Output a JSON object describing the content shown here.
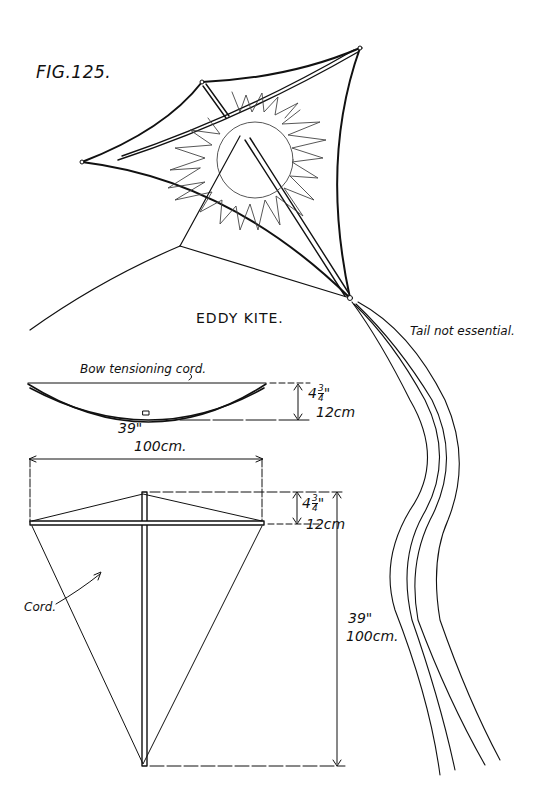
{
  "figure": {
    "number": "FIG.125.",
    "title": "EDDY KITE."
  },
  "labels": {
    "tail_note": "Tail not essential.",
    "bow_cord": "Bow tensioning cord.",
    "cord": "Cord."
  },
  "dimensions": {
    "bow_depth": {
      "whole": "4",
      "num": "3",
      "den": "4",
      "unit": "\"",
      "metric": "12cm"
    },
    "bow_width": {
      "imperial": "39\"",
      "metric": "100cm."
    },
    "frame_top": {
      "whole": "4",
      "num": "3",
      "den": "4",
      "unit": "\"",
      "metric": "12cm"
    },
    "frame_height": {
      "imperial": "39\"",
      "metric": "100cm."
    }
  }
}
